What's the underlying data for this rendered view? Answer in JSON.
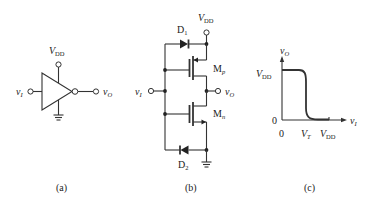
{
  "figure": {
    "panels": [
      {
        "id": "a",
        "caption": "(a)",
        "title": "inverter symbol",
        "labels": {
          "supply": "V",
          "supply_sub": "DD",
          "input": "v",
          "input_sub": "I",
          "output": "v",
          "output_sub": "O"
        }
      },
      {
        "id": "b",
        "caption": "(b)",
        "title": "CMOS inverter with protection diodes",
        "labels": {
          "supply": "V",
          "supply_sub": "DD",
          "input": "v",
          "input_sub": "I",
          "output": "v",
          "output_sub": "O",
          "d1": "D",
          "d1_sub": "1",
          "d2": "D",
          "d2_sub": "2",
          "mp": "M",
          "mp_sub": "p",
          "mn": "M",
          "mn_sub": "n"
        }
      },
      {
        "id": "c",
        "caption": "(c)",
        "title": "voltage transfer characteristic",
        "labels": {
          "y_axis": "v",
          "y_axis_sub": "O",
          "x_axis": "v",
          "x_axis_sub": "I",
          "y_tick_high": "V",
          "y_tick_high_sub": "DD",
          "y_tick_zero": "0",
          "x_tick_zero": "0",
          "x_tick_vt": "V",
          "x_tick_vt_sub": "T",
          "x_tick_vdd": "V",
          "x_tick_vdd_sub": "DD"
        }
      }
    ]
  }
}
